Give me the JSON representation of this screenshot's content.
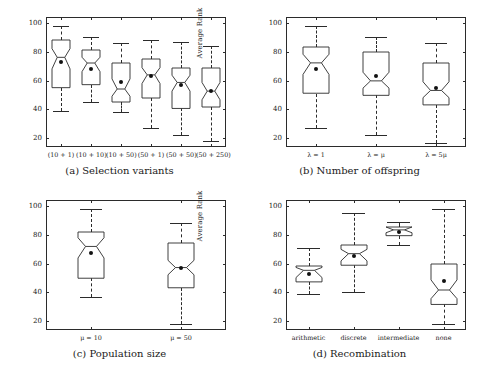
{
  "figure": {
    "ylabel": "Average Rank",
    "yticks": [
      20,
      40,
      60,
      80,
      100
    ],
    "ylim": [
      14,
      104
    ]
  },
  "chart_data": [
    {
      "type": "box",
      "panel": "a",
      "title": "(a) Selection variants",
      "ylabel": "Average Rank",
      "xlabel": "",
      "ylim": [
        14,
        104
      ],
      "yticks": [
        20,
        40,
        60,
        80,
        100
      ],
      "grid": false,
      "legend": "none",
      "categories": [
        "(10 + 1)",
        "(10 + 10)",
        "(10 + 50)",
        "(50 + 1)",
        "(50 + 50)",
        "(50 + 250)"
      ],
      "boxes": [
        {
          "label": "(10 + 1)",
          "whisker_low": 39,
          "q1": 55,
          "median": 76,
          "q3": 88,
          "whisker_high": 98,
          "notch_low": 68,
          "notch_high": 82,
          "mean": 73
        },
        {
          "label": "(10 + 10)",
          "whisker_low": 45,
          "q1": 57,
          "median": 72,
          "q3": 81,
          "whisker_high": 90,
          "notch_low": 66,
          "notch_high": 76,
          "mean": 68
        },
        {
          "label": "(10 + 50)",
          "whisker_low": 38,
          "q1": 45,
          "median": 54,
          "q3": 72,
          "whisker_high": 86,
          "notch_low": 49,
          "notch_high": 61,
          "mean": 59
        },
        {
          "label": "(50 + 1)",
          "whisker_low": 27,
          "q1": 48,
          "median": 64,
          "q3": 75,
          "whisker_high": 88,
          "notch_low": 58,
          "notch_high": 69,
          "mean": 63
        },
        {
          "label": "(50 + 50)",
          "whisker_low": 22,
          "q1": 41,
          "median": 59,
          "q3": 69,
          "whisker_high": 87,
          "notch_low": 53,
          "notch_high": 64,
          "mean": 57
        },
        {
          "label": "(50 + 250)",
          "whisker_low": 18,
          "q1": 42,
          "median": 53,
          "q3": 69,
          "whisker_high": 84,
          "notch_low": 47,
          "notch_high": 59,
          "mean": 53
        }
      ]
    },
    {
      "type": "box",
      "panel": "b",
      "title": "(b) Number of offspring",
      "ylabel": "Average Rank",
      "xlabel": "",
      "ylim": [
        14,
        104
      ],
      "yticks": [
        20,
        40,
        60,
        80,
        100
      ],
      "grid": false,
      "legend": "none",
      "categories": [
        "λ = 1",
        "λ = μ",
        "λ = 5μ"
      ],
      "boxes": [
        {
          "label": "λ = 1",
          "whisker_low": 27,
          "q1": 51,
          "median": 72,
          "q3": 83,
          "whisker_high": 98,
          "notch_low": 64,
          "notch_high": 78,
          "mean": 68
        },
        {
          "label": "λ = μ",
          "whisker_low": 22,
          "q1": 50,
          "median": 60,
          "q3": 80,
          "whisker_high": 90,
          "notch_low": 55,
          "notch_high": 66,
          "mean": 63
        },
        {
          "label": "λ = 5μ",
          "whisker_low": 17,
          "q1": 43,
          "median": 53,
          "q3": 72,
          "whisker_high": 86,
          "notch_low": 48,
          "notch_high": 59,
          "mean": 55
        }
      ]
    },
    {
      "type": "box",
      "panel": "c",
      "title": "(c) Population size",
      "ylabel": "Average Rank",
      "xlabel": "",
      "ylim": [
        14,
        104
      ],
      "yticks": [
        20,
        40,
        60,
        80,
        100
      ],
      "grid": false,
      "legend": "none",
      "categories": [
        "μ = 10",
        "μ = 50"
      ],
      "boxes": [
        {
          "label": "μ = 10",
          "whisker_low": 37,
          "q1": 50,
          "median": 72,
          "q3": 82,
          "whisker_high": 98,
          "notch_low": 64,
          "notch_high": 78,
          "mean": 67
        },
        {
          "label": "μ = 50",
          "whisker_low": 18,
          "q1": 43,
          "median": 57,
          "q3": 74,
          "whisker_high": 88,
          "notch_low": 52,
          "notch_high": 62,
          "mean": 57
        }
      ]
    },
    {
      "type": "box",
      "panel": "d",
      "title": "(d) Recombination",
      "ylabel": "Average Rank",
      "xlabel": "",
      "ylim": [
        14,
        104
      ],
      "yticks": [
        20,
        40,
        60,
        80,
        100
      ],
      "grid": false,
      "legend": "none",
      "categories": [
        "arithmetic",
        "discrete",
        "intermediate",
        "none"
      ],
      "boxes": [
        {
          "label": "arithmetic",
          "whisker_low": 39,
          "q1": 47,
          "median": 55,
          "q3": 58,
          "whisker_high": 71,
          "notch_low": 50,
          "notch_high": 57,
          "mean": 53
        },
        {
          "label": "discrete",
          "whisker_low": 40,
          "q1": 59,
          "median": 67,
          "q3": 73,
          "whisker_high": 95,
          "notch_low": 62,
          "notch_high": 70,
          "mean": 65
        },
        {
          "label": "intermediate",
          "whisker_low": 73,
          "q1": 79,
          "median": 83,
          "q3": 85,
          "whisker_high": 89,
          "notch_low": 81,
          "notch_high": 85,
          "mean": 82
        },
        {
          "label": "none",
          "whisker_low": 18,
          "q1": 32,
          "median": 42,
          "q3": 60,
          "whisker_high": 98,
          "notch_low": 36,
          "notch_high": 49,
          "mean": 48
        }
      ]
    }
  ]
}
